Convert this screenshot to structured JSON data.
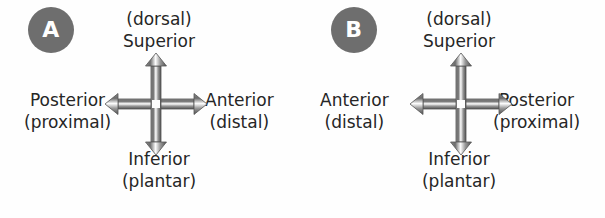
{
  "figure": {
    "background_color": "#fefefe",
    "badge_color": "#6e6e6e",
    "badge_text_color": "#ffffff",
    "arrow_color": "#5a5a5a",
    "text_color": "#262626"
  },
  "panels": [
    {
      "badge": "A",
      "top": {
        "line1": "(dorsal)",
        "line2": "Superior"
      },
      "bottom": {
        "line1": "Inferior",
        "line2": "(plantar)"
      },
      "left": {
        "line1": "Posterior",
        "line2": "(proximal)"
      },
      "right": {
        "line1": "Anterior",
        "line2": "(distal)"
      }
    },
    {
      "badge": "B",
      "top": {
        "line1": "(dorsal)",
        "line2": "Superior"
      },
      "bottom": {
        "line1": "Inferior",
        "line2": "(plantar)"
      },
      "left": {
        "line1": "Anterior",
        "line2": "(distal)"
      },
      "right": {
        "line1": "Posterior",
        "line2": "(proximal)"
      }
    }
  ]
}
